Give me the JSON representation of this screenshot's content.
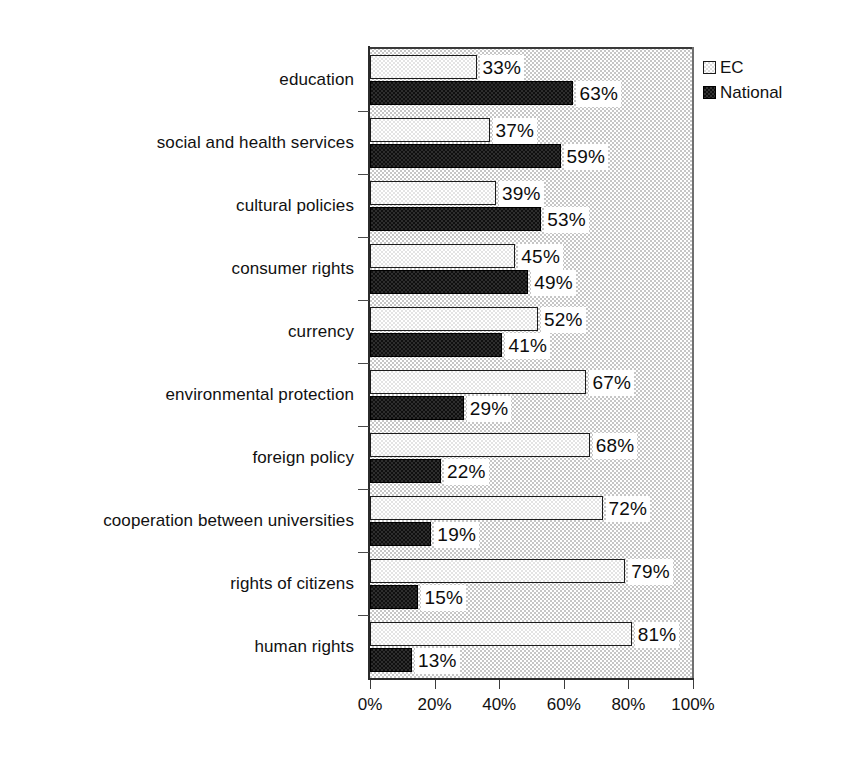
{
  "chart_data": {
    "type": "bar",
    "orientation": "horizontal",
    "title": "",
    "subtitle": "",
    "xlabel": "",
    "ylabel": "",
    "xlim": [
      0,
      100
    ],
    "xtick_labels": [
      "0%",
      "20%",
      "40%",
      "60%",
      "80%",
      "100%"
    ],
    "xticks": [
      0,
      20,
      40,
      60,
      80,
      100
    ],
    "grid": false,
    "legend_position": "top-right",
    "value_suffix": "%",
    "categories": [
      "education",
      "social and health services",
      "cultural policies",
      "consumer rights",
      "currency",
      "environmental protection",
      "foreign policy",
      "cooperation between universities",
      "rights of citizens",
      "human rights"
    ],
    "series": [
      {
        "name": "EC",
        "color": "#dcdcdc",
        "values": [
          33,
          37,
          39,
          45,
          52,
          67,
          68,
          72,
          79,
          81
        ],
        "labels": [
          "33%",
          "37%",
          "39%",
          "45%",
          "52%",
          "67%",
          "68%",
          "72%",
          "79%",
          "81%"
        ]
      },
      {
        "name": "National",
        "color": "#111111",
        "values": [
          63,
          59,
          53,
          49,
          41,
          29,
          22,
          19,
          15,
          13
        ],
        "labels": [
          "63%",
          "59%",
          "53%",
          "49%",
          "41%",
          "29%",
          "22%",
          "19%",
          "15%",
          "13%"
        ]
      }
    ]
  },
  "legend": {
    "items": [
      {
        "label": "EC",
        "swatch": "ec-swatch-icon"
      },
      {
        "label": "National",
        "swatch": "national-swatch-icon"
      }
    ]
  }
}
